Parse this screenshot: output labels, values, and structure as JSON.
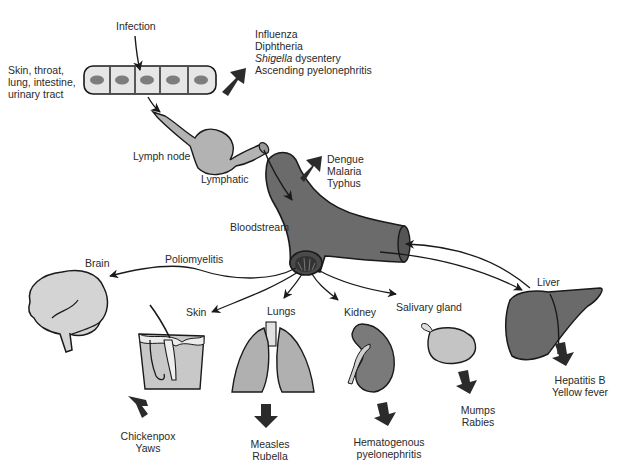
{
  "colors": {
    "cell_fill": "#e6e6e6",
    "nucleus": "#7d7d7d",
    "lymph": "#b3b3b3",
    "vessel": "#6b6b6b",
    "organ_light": "#c8c8c8",
    "organ_mid": "#a8a8a8",
    "organ_dark": "#707070",
    "arrow": "#2b2b2b",
    "line": "#1a1a1a"
  },
  "entry": {
    "infection_label": "Infection",
    "sites_lines": [
      "Skin, throat,",
      "lung, intestine,",
      "urinary tract"
    ],
    "local_diseases": [
      "Influenza",
      "Diphtheria",
      "Shigella dysentery",
      "Ascending pyelonephritis"
    ],
    "local_italic_word": "Shigella",
    "local_rest": " dysentery"
  },
  "lymph": {
    "node_label": "Lymph node",
    "lymphatic_label": "Lymphatic"
  },
  "blood": {
    "label": "Bloodstream",
    "diseases": [
      "Dengue",
      "Malaria",
      "Typhus"
    ]
  },
  "organs": [
    {
      "name": "Brain",
      "route_label": "Poliomyelitis",
      "diseases": []
    },
    {
      "name": "Skin",
      "diseases": [
        "Chickenpox",
        "Yaws"
      ]
    },
    {
      "name": "Lungs",
      "diseases": [
        "Measles",
        "Rubella"
      ]
    },
    {
      "name": "Kidney",
      "diseases": [
        "Hematogenous",
        "pyelonephritis"
      ]
    },
    {
      "name": "Salivary gland",
      "diseases": [
        "Mumps",
        "Rabies"
      ]
    },
    {
      "name": "Liver",
      "diseases": [
        "Hepatitis B",
        "Yellow fever"
      ]
    }
  ]
}
